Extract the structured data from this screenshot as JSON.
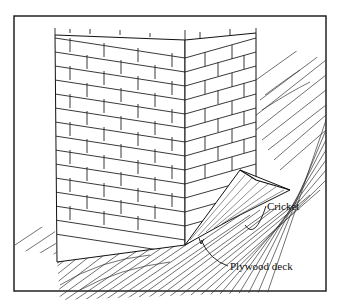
{
  "figure": {
    "labels": {
      "cricket": "Cricket",
      "plywood_deck": "Plywood deck"
    },
    "colors": {
      "line": "#1a1a1a",
      "background": "#ffffff"
    }
  }
}
